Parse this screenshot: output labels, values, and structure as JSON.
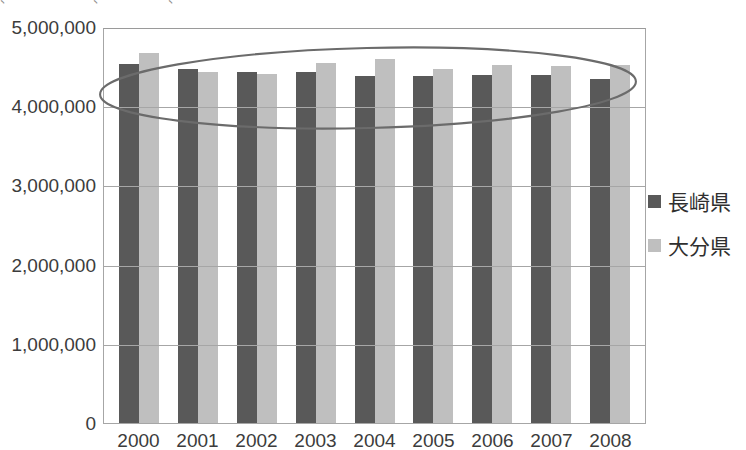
{
  "top_caption_fragment": "、 ・ ・ ・ ・  、 ・  ・ ・ 、 ・ ・ ・ ・",
  "legend": {
    "position": "right",
    "items": [
      {
        "label": "長崎県",
        "color": "#595959",
        "swatch_icon": "legend-swatch-square"
      },
      {
        "label": "大分県",
        "color": "#bfbfbf",
        "swatch_icon": "legend-swatch-square"
      }
    ]
  },
  "annotation": {
    "type": "ellipse-highlight",
    "name": "ellipse-annotation",
    "color": "#6b6b6b",
    "covers": "all bar tops, 2000-2008"
  },
  "axis": {
    "y_ticks": [
      "0",
      "1,000,000",
      "2,000,000",
      "3,000,000",
      "4,000,000",
      "5,000,000"
    ],
    "x_ticks": [
      "2000",
      "2001",
      "2002",
      "2003",
      "2004",
      "2005",
      "2006",
      "2007",
      "2008"
    ]
  },
  "chart_data": {
    "type": "bar",
    "title": "",
    "subtitle": "",
    "xlabel": "",
    "ylabel": "",
    "ylim": [
      0,
      5000000
    ],
    "ytick_step": 1000000,
    "grid": true,
    "legend_position": "right",
    "categories": [
      "2000",
      "2001",
      "2002",
      "2003",
      "2004",
      "2005",
      "2006",
      "2007",
      "2008"
    ],
    "series": [
      {
        "name": "長崎県",
        "color": "#595959",
        "values": [
          4560000,
          4490000,
          4460000,
          4450000,
          4400000,
          4410000,
          4420000,
          4420000,
          4370000
        ]
      },
      {
        "name": "大分県",
        "color": "#bfbfbf",
        "values": [
          4690000,
          4450000,
          4430000,
          4570000,
          4620000,
          4490000,
          4540000,
          4530000,
          4540000
        ]
      }
    ]
  }
}
